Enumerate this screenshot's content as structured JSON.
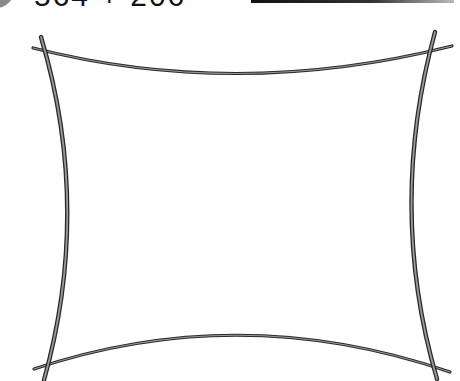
{
  "worksheet": {
    "equation": "564 + 206",
    "answer_blank": "",
    "drawing": {
      "shape": "concave-rectangle-frame",
      "stroke_color": "#2a2a2a",
      "inner_stroke_color": "#9a9a9a"
    }
  }
}
